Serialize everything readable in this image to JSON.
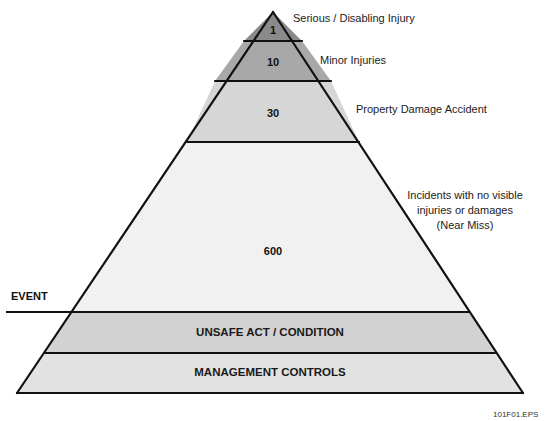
{
  "diagram": {
    "type": "accident-pyramid",
    "layers": [
      {
        "value": "1",
        "label": "Serious / Disabling Injury",
        "color": "#8a8a8a"
      },
      {
        "value": "10",
        "label": "Minor Injuries",
        "color": "#a8a8a8"
      },
      {
        "value": "30",
        "label": "Property Damage Accident",
        "color": "#d6d6d6"
      },
      {
        "value": "600",
        "label": "Incidents with no visible injuries or damages (Near Miss)",
        "label_lines": [
          "Incidents with no visible",
          "injuries or damages",
          "(Near Miss)"
        ],
        "color": "#f1f1f1"
      }
    ],
    "bands": [
      {
        "label": "UNSAFE ACT / CONDITION",
        "color": "#d2d2d2"
      },
      {
        "label": "MANAGEMENT CONTROLS",
        "color": "#e2e2e2"
      }
    ],
    "event_label": "EVENT",
    "figure_id": "101F01.EPS",
    "outline_color": "#111111"
  }
}
